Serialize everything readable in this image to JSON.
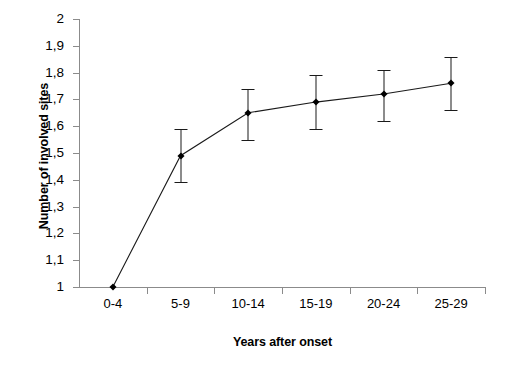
{
  "chart_data": {
    "type": "line",
    "title": "",
    "xlabel": "Years after onset",
    "ylabel": "Number of involved sites",
    "categories": [
      "0-4",
      "5-9",
      "10-14",
      "15-19",
      "20-24",
      "25-29"
    ],
    "values": [
      1.0,
      1.49,
      1.65,
      1.69,
      1.72,
      1.76
    ],
    "error_low": [
      1.0,
      1.39,
      1.55,
      1.59,
      1.62,
      1.66
    ],
    "error_high": [
      1.0,
      1.59,
      1.74,
      1.79,
      1.81,
      1.86
    ],
    "ylim": [
      1,
      2
    ],
    "ytick_labels": [
      "2",
      "1,9",
      "1,8",
      "1,7",
      "1,6",
      "1,5",
      "1,4",
      "1,3",
      "1,2",
      "1,1",
      "1"
    ],
    "ytick_values": [
      2,
      1.9,
      1.8,
      1.7,
      1.6,
      1.5,
      1.4,
      1.3,
      1.2,
      1.1,
      1
    ],
    "grid": false,
    "legend": "none",
    "marker": "filled-diamond",
    "series": [
      {
        "name": "Number of involved sites",
        "values": [
          1.0,
          1.49,
          1.65,
          1.69,
          1.72,
          1.76
        ]
      }
    ],
    "colors": {
      "line": "#1a1a1a",
      "marker": "#000000",
      "axis": "#8b8b8b",
      "background": "#ffffff"
    }
  }
}
